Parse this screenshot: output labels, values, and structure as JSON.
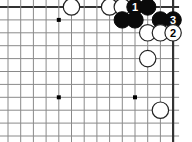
{
  "app": {
    "title": "Go Board Diagram",
    "kind": "go-game-diagram"
  },
  "board": {
    "background_color": "#ffffff",
    "line_color": "#8a8a8a",
    "border_color": "#333333",
    "black_stone_color": "#0a0a0a",
    "white_stone_color": "#ffffff",
    "white_stone_outline": "#222222",
    "star_point_color": "#000000",
    "cols": 14,
    "rows": 11,
    "origin_x": 8,
    "origin_y": 7,
    "cell_w": 12.7,
    "cell_h": 12.9,
    "stone_radius": 8.2,
    "star_radius": 2.0,
    "star_points": [
      {
        "col": 5,
        "row": 2
      },
      {
        "col": 5,
        "row": 8
      },
      {
        "col": 11,
        "row": 8
      }
    ]
  },
  "stones": [
    {
      "id": "w-a",
      "color": "white",
      "col": 6,
      "row": 1,
      "label": ""
    },
    {
      "id": "w-b",
      "color": "white",
      "col": 9,
      "row": 1,
      "label": ""
    },
    {
      "id": "w-c",
      "color": "white",
      "col": 10,
      "row": 1,
      "label": ""
    },
    {
      "id": "b-1",
      "color": "black",
      "col": 11,
      "row": 1,
      "label": "1"
    },
    {
      "id": "b-d",
      "color": "black",
      "col": 12,
      "row": 1,
      "label": ""
    },
    {
      "id": "b-e",
      "color": "black",
      "col": 10,
      "row": 2,
      "label": ""
    },
    {
      "id": "b-f",
      "color": "black",
      "col": 11,
      "row": 2,
      "label": ""
    },
    {
      "id": "b-g",
      "color": "black",
      "col": 13,
      "row": 2,
      "label": ""
    },
    {
      "id": "b-3",
      "color": "black",
      "col": 14,
      "row": 2,
      "label": "3"
    },
    {
      "id": "w-d",
      "color": "white",
      "col": 12,
      "row": 3,
      "label": ""
    },
    {
      "id": "w-e",
      "color": "white",
      "col": 13,
      "row": 3,
      "label": ""
    },
    {
      "id": "w-2",
      "color": "white",
      "col": 14,
      "row": 3,
      "label": "2"
    },
    {
      "id": "w-f",
      "color": "white",
      "col": 12,
      "row": 5,
      "label": ""
    },
    {
      "id": "w-g",
      "color": "white",
      "col": 13,
      "row": 9,
      "label": ""
    }
  ],
  "move_numbers": {
    "one": "1",
    "two": "2",
    "three": "3"
  }
}
